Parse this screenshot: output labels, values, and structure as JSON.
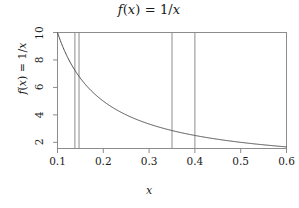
{
  "chart_data": {
    "type": "line",
    "title": "f(x) = 1/x",
    "xlabel": "x",
    "ylabel": "f(x) = 1/x",
    "function": "1/x",
    "xlim": [
      0.1,
      0.6
    ],
    "ylim": [
      1.55,
      10.0
    ],
    "grid": false,
    "legend": "none",
    "xticks": [
      0.1,
      0.2,
      0.3,
      0.4,
      0.5,
      0.6
    ],
    "xtick_labels": [
      "0.1",
      "0.2",
      "0.3",
      "0.4",
      "0.5",
      "0.6"
    ],
    "yticks": [
      2,
      4,
      6,
      8,
      10
    ],
    "ytick_labels": [
      "2",
      "4",
      "6",
      "8",
      "10"
    ],
    "series": [
      {
        "name": "f(x) = 1/x",
        "color": "#4d4d4d",
        "x": [
          0.1,
          0.11,
          0.12,
          0.13,
          0.14,
          0.15,
          0.16,
          0.17,
          0.18,
          0.19,
          0.2,
          0.22,
          0.24,
          0.26,
          0.28,
          0.3,
          0.32,
          0.34,
          0.36,
          0.38,
          0.4,
          0.42,
          0.44,
          0.46,
          0.48,
          0.5,
          0.52,
          0.54,
          0.56,
          0.58,
          0.6
        ],
        "values": [
          10.0,
          9.09,
          8.33,
          7.69,
          7.14,
          6.67,
          6.25,
          5.88,
          5.56,
          5.26,
          5.0,
          4.55,
          4.17,
          3.85,
          3.57,
          3.33,
          3.13,
          2.94,
          2.78,
          2.63,
          2.5,
          2.38,
          2.27,
          2.17,
          2.08,
          2.0,
          1.92,
          1.85,
          1.79,
          1.72,
          1.67
        ]
      }
    ],
    "vertical_lines": [
      {
        "x": 0.138,
        "color": "#8c8c8c"
      },
      {
        "x": 0.147,
        "color": "#8c8c8c"
      },
      {
        "x": 0.35,
        "color": "#8c8c8c"
      },
      {
        "x": 0.4,
        "color": "#8c8c8c"
      }
    ],
    "axis_color": "#8c8c8c",
    "box": true
  }
}
